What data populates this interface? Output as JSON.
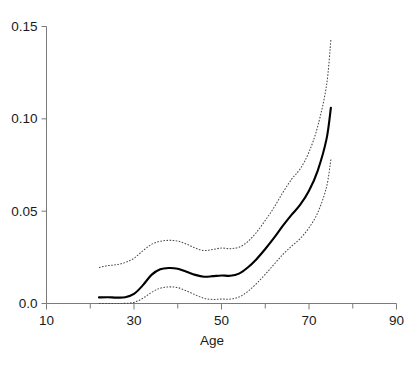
{
  "chart_data": {
    "type": "line",
    "title": "",
    "subtitle": "",
    "xlabel": "Age",
    "ylabel": "",
    "xlim": [
      10,
      90
    ],
    "ylim": [
      0.0,
      0.15
    ],
    "grid": false,
    "legend": null,
    "x_ticks": [
      10,
      30,
      50,
      70,
      90
    ],
    "x_tick_labels": [
      "10",
      "30",
      "50",
      "70",
      "90"
    ],
    "x_minor_ticks": [
      20,
      40,
      60,
      80
    ],
    "y_ticks": [
      0.0,
      0.05,
      0.1,
      0.15
    ],
    "y_tick_labels": [
      "0.0",
      "0.05",
      "0.10",
      "0.15"
    ],
    "x": [
      22,
      24,
      26,
      28,
      30,
      32,
      34,
      36,
      38,
      40,
      42,
      44,
      46,
      48,
      50,
      52,
      54,
      56,
      58,
      60,
      62,
      64,
      66,
      68,
      70,
      72,
      74,
      75
    ],
    "series": [
      {
        "name": "upper confidence band",
        "style": "dotted",
        "color": "#4a4a4a",
        "values": [
          0.0195,
          0.0205,
          0.021,
          0.0222,
          0.0245,
          0.0285,
          0.032,
          0.0337,
          0.0342,
          0.0338,
          0.0322,
          0.03,
          0.0287,
          0.0293,
          0.03,
          0.0297,
          0.0305,
          0.0335,
          0.0385,
          0.045,
          0.052,
          0.06,
          0.0672,
          0.073,
          0.082,
          0.096,
          0.118,
          0.143
        ]
      },
      {
        "name": "fitted curve",
        "style": "solid",
        "color": "#000000",
        "values": [
          0.0033,
          0.0034,
          0.0032,
          0.0034,
          0.0052,
          0.0098,
          0.0155,
          0.0185,
          0.0192,
          0.0188,
          0.0172,
          0.0155,
          0.0145,
          0.0148,
          0.0152,
          0.015,
          0.0162,
          0.0195,
          0.024,
          0.0295,
          0.0355,
          0.042,
          0.048,
          0.0535,
          0.061,
          0.072,
          0.089,
          0.106
        ]
      },
      {
        "name": "lower confidence band",
        "style": "dotted",
        "color": "#4a4a4a",
        "values": [
          0.0,
          0.0,
          0.0,
          0.0001,
          0.0006,
          0.0028,
          0.006,
          0.0083,
          0.009,
          0.0086,
          0.0068,
          0.0047,
          0.0028,
          0.0022,
          0.0024,
          0.0024,
          0.0035,
          0.0065,
          0.0108,
          0.0158,
          0.0212,
          0.0265,
          0.031,
          0.0352,
          0.041,
          0.0492,
          0.063,
          0.078
        ]
      }
    ]
  },
  "axes": {
    "x_title": "Age"
  }
}
